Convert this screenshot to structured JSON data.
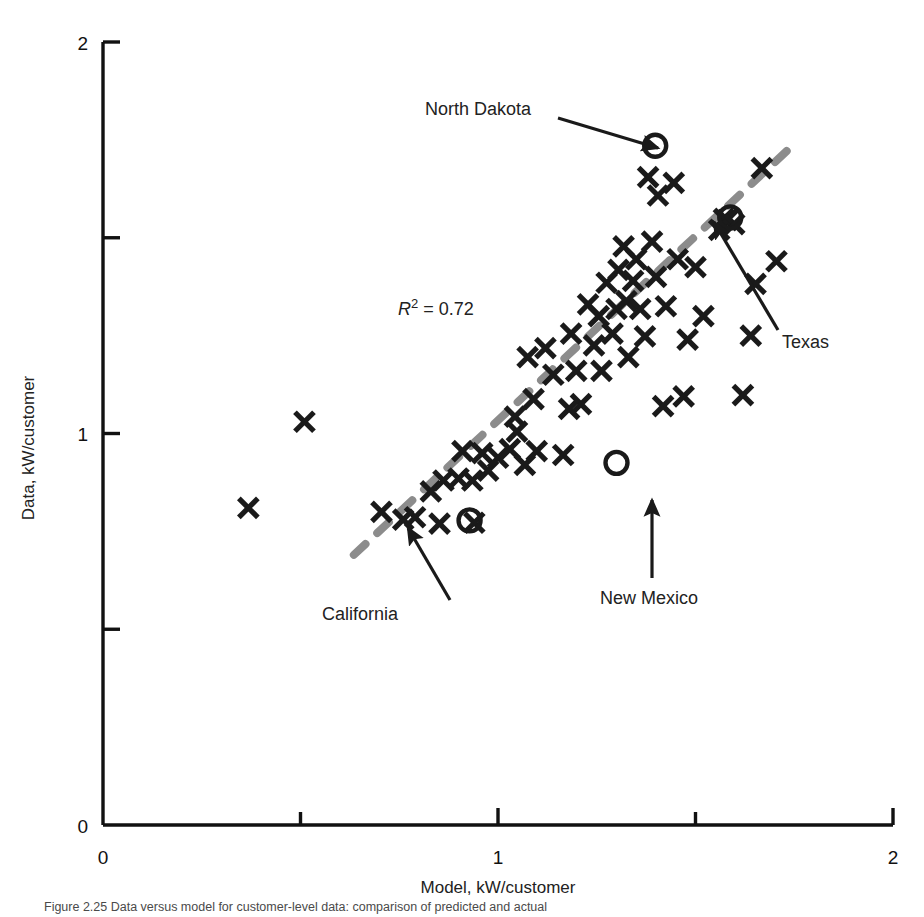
{
  "chart_data": {
    "type": "scatter",
    "title": "",
    "xlabel": "Model, kW/customer",
    "ylabel": "Data, kW/customer",
    "xlim": [
      0,
      2
    ],
    "ylim": [
      0,
      2
    ],
    "xticks": [
      0,
      0.5,
      1,
      1.5,
      2
    ],
    "yticks": [
      0,
      0.5,
      1,
      1.5,
      2
    ],
    "xtick_labels": [
      "0",
      "",
      "1",
      "",
      "2"
    ],
    "ytick_labels": [
      "0",
      "",
      "1",
      "",
      "2"
    ],
    "grid": false,
    "legend": "none",
    "annotation_r2": "R² = 0.72",
    "r2_prefix": "R",
    "r2_exponent": "2",
    "r2_value": "= 0.72",
    "series": [
      {
        "name": "states",
        "marker": "x",
        "color": "#1a1a1a",
        "points": [
          [
            0.705,
            0.8
          ],
          [
            0.76,
            0.78
          ],
          [
            0.79,
            0.786
          ],
          [
            0.83,
            0.852
          ],
          [
            0.852,
            0.77
          ],
          [
            0.862,
            0.88
          ],
          [
            0.9,
            0.885
          ],
          [
            0.91,
            0.955
          ],
          [
            0.935,
            0.88
          ],
          [
            0.94,
            0.772
          ],
          [
            0.96,
            0.95
          ],
          [
            0.975,
            0.905
          ],
          [
            1.0,
            0.938
          ],
          [
            1.03,
            0.96
          ],
          [
            1.043,
            1.043
          ],
          [
            1.048,
            1.005
          ],
          [
            1.068,
            0.92
          ],
          [
            1.075,
            1.195
          ],
          [
            1.09,
            1.088
          ],
          [
            1.098,
            0.955
          ],
          [
            1.12,
            1.218
          ],
          [
            1.14,
            1.15
          ],
          [
            1.165,
            0.945
          ],
          [
            1.18,
            1.063
          ],
          [
            1.185,
            1.255
          ],
          [
            1.198,
            1.16
          ],
          [
            1.21,
            1.075
          ],
          [
            1.228,
            1.33
          ],
          [
            1.243,
            1.225
          ],
          [
            1.255,
            1.3
          ],
          [
            1.262,
            1.16
          ],
          [
            1.275,
            1.385
          ],
          [
            1.29,
            1.255
          ],
          [
            1.3,
            1.318
          ],
          [
            1.305,
            1.418
          ],
          [
            1.318,
            1.478
          ],
          [
            1.325,
            1.338
          ],
          [
            1.33,
            1.195
          ],
          [
            1.342,
            1.39
          ],
          [
            1.35,
            1.445
          ],
          [
            1.36,
            1.318
          ],
          [
            1.372,
            1.248
          ],
          [
            1.38,
            1.655
          ],
          [
            1.39,
            1.49
          ],
          [
            1.4,
            1.4
          ],
          [
            1.405,
            1.608
          ],
          [
            1.418,
            1.07
          ],
          [
            1.425,
            1.325
          ],
          [
            1.445,
            1.64
          ],
          [
            1.455,
            1.445
          ],
          [
            1.47,
            1.095
          ],
          [
            1.48,
            1.24
          ],
          [
            1.5,
            1.425
          ],
          [
            1.52,
            1.3
          ],
          [
            1.56,
            1.52
          ],
          [
            1.572,
            1.548
          ],
          [
            1.58,
            1.545
          ],
          [
            1.598,
            1.535
          ],
          [
            1.62,
            1.098
          ],
          [
            1.64,
            1.25
          ],
          [
            1.652,
            1.382
          ],
          [
            1.668,
            1.678
          ],
          [
            1.705,
            1.44
          ],
          [
            0.51,
            1.03
          ],
          [
            0.368,
            0.81
          ]
        ]
      },
      {
        "name": "highlighted-states",
        "marker": "o",
        "color": "#1a1a1a",
        "points": [
          {
            "label": "North Dakota",
            "x": 1.398,
            "y": 1.735
          },
          {
            "label": "Texas",
            "x": 1.588,
            "y": 1.552
          },
          {
            "label": "New Mexico",
            "x": 1.3,
            "y": 0.925
          },
          {
            "label": "California",
            "x": 0.928,
            "y": 0.778
          }
        ]
      }
    ],
    "trendline": {
      "style": "dashed",
      "color": "#8c8c8c",
      "x0": 0.635,
      "y0": 0.69,
      "x1": 1.74,
      "y1": 1.73
    },
    "annotations": [
      {
        "name": "north-dakota",
        "label": "North Dakota",
        "text_x": 425,
        "text_y": 115,
        "arrow_x0": 558,
        "arrow_y0": 118,
        "arrow_x1": 658,
        "arrow_y1": 148
      },
      {
        "name": "texas",
        "label": "Texas",
        "text_x": 782,
        "text_y": 348,
        "arrow_x0": 778,
        "arrow_y0": 330,
        "arrow_x1": 714,
        "arrow_y1": 222
      },
      {
        "name": "new-mexico",
        "label": "New Mexico",
        "text_x": 600,
        "text_y": 604,
        "arrow_x0": 652,
        "arrow_y0": 578,
        "arrow_x1": 652,
        "arrow_y1": 500
      },
      {
        "name": "california",
        "label": "California",
        "text_x": 322,
        "text_y": 620,
        "arrow_x0": 450,
        "arrow_y0": 600,
        "arrow_x1": 408,
        "arrow_y1": 528
      }
    ]
  },
  "axes": {
    "x_title": "Model, kW/customer",
    "y_title": "Data, kW/customer",
    "x_ticks": [
      {
        "value": 0,
        "label": "0"
      },
      {
        "value": 0.5,
        "label": ""
      },
      {
        "value": 1,
        "label": "1"
      },
      {
        "value": 1.5,
        "label": ""
      },
      {
        "value": 2,
        "label": "2"
      }
    ],
    "y_ticks": [
      {
        "value": 0,
        "label": "0"
      },
      {
        "value": 0.5,
        "label": ""
      },
      {
        "value": 1,
        "label": "1"
      },
      {
        "value": 1.5,
        "label": ""
      },
      {
        "value": 2,
        "label": "2"
      }
    ],
    "x_label_0": "0",
    "x_label_1": "1",
    "x_label_2": "2",
    "y_label_0": "0",
    "y_label_1": "1",
    "y_label_2": "2"
  },
  "caption": {
    "text": "Figure 2.25  Data versus model for customer-level data: comparison of predicted and actual"
  },
  "colors": {
    "marker": "#1a1a1a",
    "trendline": "#8c8c8c",
    "axis": "#111111",
    "text": "#222222",
    "caption": "#4a4a4a"
  }
}
